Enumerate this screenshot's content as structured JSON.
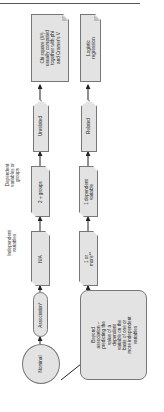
{
  "diagram": {
    "orientation": "rotated-90-ccw",
    "colors": {
      "node_fill": "#e3e3e3",
      "node_border": "#777777",
      "arrow": "#222222",
      "text": "#222222"
    },
    "side_labels": {
      "dependent": "Dependent\nvariables or\ngroups",
      "independent": "Independent\nvariables"
    },
    "left_column": {
      "start": "Nominal",
      "step1": "Association*",
      "independent_value": "N/A",
      "dependent_value": "2 + groups",
      "relation": "Unrelated",
      "result": "Chi square (X²)\nusually computed\ntogether with phi\nand Cramer's V"
    },
    "right_column": {
      "step1": "Beyond\nassociation –\npredicting the\nvalue of a\ndependent\nvariable on the\nbasis of one or\nmore independent\nvariables",
      "independent_value": "1 or\nmore**",
      "dependent_value": "1 dependent\nvariable",
      "relation": "Related",
      "result": "Logistic\nregression"
    }
  }
}
